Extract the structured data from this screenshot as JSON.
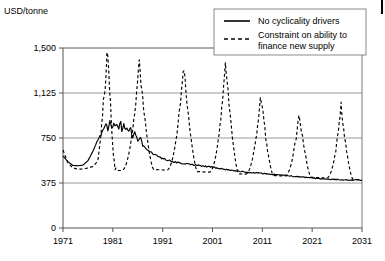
{
  "figure": {
    "unit_label": "USD/tonne",
    "width": 385,
    "height": 261
  },
  "legend": {
    "position": "top-right",
    "entries": [
      {
        "label": "No cyclicality drivers",
        "style": "solid",
        "color": "#000000"
      },
      {
        "label": "Constraint on ability to finance new supply",
        "style": "dashed",
        "color": "#000000"
      }
    ],
    "line1_label": "No cyclicality drivers",
    "line2_label_a": "Constraint on ability to",
    "line2_label_b": "finance new supply"
  },
  "chart_data": {
    "type": "line",
    "title": "",
    "subtitle": "",
    "xlabel": "",
    "ylabel": "USD/tonne",
    "xlim": [
      1971,
      2031
    ],
    "ylim": [
      0,
      1500
    ],
    "yticks": [
      0,
      375,
      750,
      1125,
      1500
    ],
    "ytick_labels": [
      "0",
      "375",
      "750",
      "1,125",
      "1,500"
    ],
    "xticks": [
      1971,
      1981,
      1991,
      2001,
      2011,
      2021,
      2031
    ],
    "xtick_labels": [
      "1971",
      "1981",
      "1991",
      "2001",
      "2011",
      "2021",
      "2031"
    ],
    "grid": "horizontal",
    "legend_position": "top-right",
    "series": [
      {
        "name": "No cyclicality drivers",
        "style": "solid",
        "color": "#000000",
        "x": [
          1971,
          1972,
          1973,
          1974,
          1975,
          1976,
          1977,
          1978,
          1979,
          1979.5,
          1980,
          1980.5,
          1981,
          1981.5,
          1982,
          1982.5,
          1983,
          1983.5,
          1984,
          1984.5,
          1985,
          1985.5,
          1986,
          1986.5,
          1987,
          1988,
          1989,
          1990,
          1991,
          1992,
          1993,
          1994,
          1995,
          1996,
          1997,
          1998,
          1999,
          2000,
          2001,
          2003,
          2005,
          2007,
          2009,
          2011,
          2013,
          2015,
          2017,
          2019,
          2021,
          2023,
          2025,
          2027,
          2029,
          2031
        ],
        "values": [
          600,
          553,
          521,
          519,
          524,
          560,
          640,
          735,
          812,
          866,
          830,
          880,
          845,
          872,
          838,
          862,
          824,
          856,
          800,
          836,
          762,
          800,
          722,
          756,
          690,
          648,
          620,
          598,
          578,
          566,
          552,
          545,
          540,
          534,
          528,
          524,
          518,
          512,
          505,
          492,
          480,
          470,
          462,
          455,
          448,
          440,
          432,
          424,
          416,
          410,
          406,
          402,
          400,
          398
        ]
      },
      {
        "name": "Constraint on ability to finance new supply",
        "style": "dashed",
        "color": "#000000",
        "x": [
          1971,
          1972,
          1973,
          1974,
          1975,
          1976,
          1977,
          1978,
          1978.6,
          1979.1,
          1979.6,
          1979.9,
          1980.2,
          1980.6,
          1981,
          1981.4,
          1982,
          1983,
          1984,
          1985,
          1986,
          1987,
          1988,
          1989,
          1990,
          1991,
          1992,
          1993,
          1994,
          1995,
          1996,
          1997,
          1998,
          1999,
          2000,
          2001,
          2002,
          2003,
          2004,
          2005,
          2006,
          2007,
          2008,
          2009,
          2010,
          2011,
          2012,
          2013,
          2014,
          2015,
          2016,
          2017,
          2018,
          2019,
          2020,
          2021,
          2022,
          2023,
          2024,
          2025,
          2026,
          2027,
          2028,
          2029,
          2030,
          2031
        ],
        "values": [
          650,
          540,
          500,
          490,
          492,
          500,
          512,
          560,
          760,
          1050,
          1230,
          1500,
          1290,
          980,
          640,
          500,
          480,
          478,
          478,
          480,
          482,
          484,
          486,
          488,
          486,
          484,
          482,
          480,
          478,
          476,
          474,
          472,
          470,
          468,
          466,
          464,
          462,
          460,
          458,
          455,
          452,
          450,
          448,
          446,
          444,
          442,
          440,
          438,
          436,
          434,
          432,
          430,
          428,
          426,
          424,
          422,
          420,
          418,
          416,
          414,
          412,
          410,
          408,
          406,
          404,
          402
        ]
      }
    ],
    "cyclic_peaks": [
      {
        "year_peak": 1980.0,
        "height": 1500,
        "width": 2.6,
        "shoulder": 1030,
        "note": "first-cycle-peak"
      },
      {
        "year_peak": 1986.3,
        "height": 1375,
        "width": 2.3,
        "shoulder": 1140,
        "note": "second-cycle-peak"
      },
      {
        "year_peak": 1995.2,
        "height": 1370,
        "width": 2.2,
        "shoulder": 1130,
        "note": "third-cycle-peak"
      },
      {
        "year_peak": 2003.6,
        "height": 1395,
        "width": 2.1,
        "shoulder": 1080,
        "note": "fourth-cycle-peak"
      },
      {
        "year_peak": 2010.7,
        "height": 1120,
        "width": 2.0,
        "shoulder": 930,
        "note": "fifth-cycle-peak"
      },
      {
        "year_peak": 2018.4,
        "height": 970,
        "width": 1.9,
        "shoulder": 820,
        "note": "sixth-cycle-peak"
      },
      {
        "year_peak": 2026.8,
        "height": 1010,
        "width": 1.9,
        "shoulder": 790,
        "note": "seventh-cycle-peak"
      }
    ],
    "baseline_series": {
      "name": "dashed-baseline",
      "start_value": 500,
      "end_value": 400
    }
  }
}
